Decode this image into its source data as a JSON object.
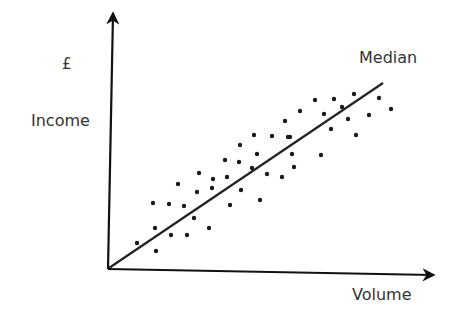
{
  "chart_data": {
    "type": "scatter",
    "title": "",
    "xlabel": "Volume",
    "ylabel": "Income",
    "y_unit": "£",
    "grid": false,
    "legend": null,
    "annotations": [
      {
        "text": "Median",
        "target": "trend-line"
      }
    ],
    "axes": {
      "origin": [
        108,
        269
      ],
      "x_axis_end": [
        433,
        275
      ],
      "y_axis_end": [
        113,
        14
      ]
    },
    "trend_line": {
      "name": "Median",
      "start": [
        109,
        268
      ],
      "end": [
        383,
        83
      ]
    },
    "points": [
      [
        137,
        243
      ],
      [
        156,
        251
      ],
      [
        153,
        203
      ],
      [
        155,
        228
      ],
      [
        169,
        204
      ],
      [
        171,
        235
      ],
      [
        178,
        184
      ],
      [
        184,
        206
      ],
      [
        187,
        235
      ],
      [
        194,
        218
      ],
      [
        197,
        192
      ],
      [
        199,
        173
      ],
      [
        209,
        228
      ],
      [
        212,
        188
      ],
      [
        213,
        179
      ],
      [
        225,
        160
      ],
      [
        227,
        177
      ],
      [
        230,
        205
      ],
      [
        239,
        162
      ],
      [
        240,
        145
      ],
      [
        241,
        190
      ],
      [
        252,
        168
      ],
      [
        254,
        135
      ],
      [
        257,
        154
      ],
      [
        260,
        200
      ],
      [
        267,
        174
      ],
      [
        272,
        136
      ],
      [
        282,
        177
      ],
      [
        285,
        121
      ],
      [
        288,
        137
      ],
      [
        290,
        137
      ],
      [
        292,
        154
      ],
      [
        294,
        167
      ],
      [
        300,
        111
      ],
      [
        315,
        100
      ],
      [
        321,
        155
      ],
      [
        324,
        114
      ],
      [
        331,
        129
      ],
      [
        334,
        99
      ],
      [
        342,
        107
      ],
      [
        348,
        119
      ],
      [
        354,
        94
      ],
      [
        356,
        135
      ],
      [
        369,
        115
      ],
      [
        379,
        98
      ],
      [
        391,
        109
      ]
    ],
    "point_radius": 2.2,
    "colors": {
      "axis": "#111111",
      "points": "#1a1a1a",
      "line": "#222222",
      "text": "#333333"
    }
  },
  "labels": {
    "currency": "£",
    "y_axis": "Income",
    "x_axis": "Volume",
    "trend": "Median"
  }
}
